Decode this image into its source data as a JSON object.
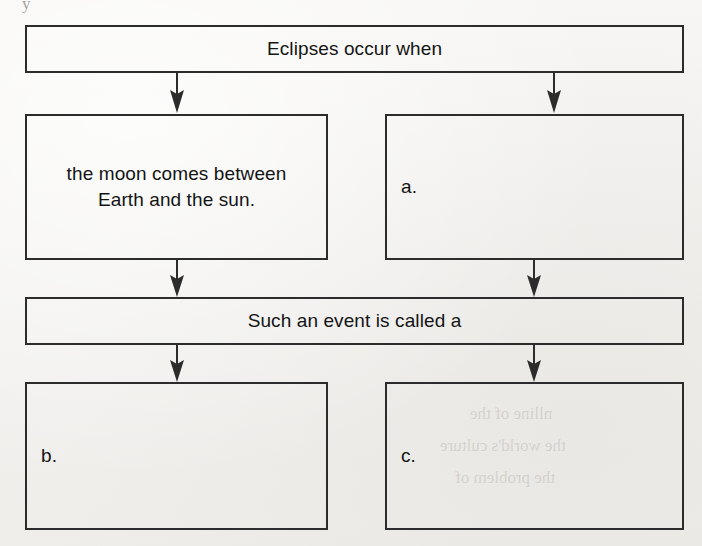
{
  "diagram": {
    "title_node": {
      "id": "eclipses-occur-when",
      "text": "Eclipses occur when"
    },
    "cause_nodes": [
      {
        "id": "cause-left",
        "text": "the moon comes between\nEarth and the sun.",
        "filled": true
      },
      {
        "id": "cause-right-a",
        "text": "a.",
        "filled": false
      }
    ],
    "connector_node": {
      "id": "such-an-event-is-called-a",
      "text": "Such an event is called a"
    },
    "result_nodes": [
      {
        "id": "result-b",
        "text": "b.",
        "filled": false
      },
      {
        "id": "result-c",
        "text": "c.",
        "filled": false
      }
    ],
    "arrows": [
      {
        "id": "arrow-title-to-cause-left"
      },
      {
        "id": "arrow-title-to-cause-right"
      },
      {
        "id": "arrow-cause-left-to-connector"
      },
      {
        "id": "arrow-cause-right-to-connector"
      },
      {
        "id": "arrow-connector-to-result-b"
      },
      {
        "id": "arrow-connector-to-result-c"
      }
    ],
    "artifacts": {
      "corner_descender": "y",
      "bleed_line_1": "nlline of the",
      "bleed_line_2": "the world's culture",
      "bleed_line_3": "the problem of"
    },
    "colors": {
      "paper": "#f4f3f1",
      "ink": "#2c2c2c",
      "text": "#141414"
    }
  }
}
